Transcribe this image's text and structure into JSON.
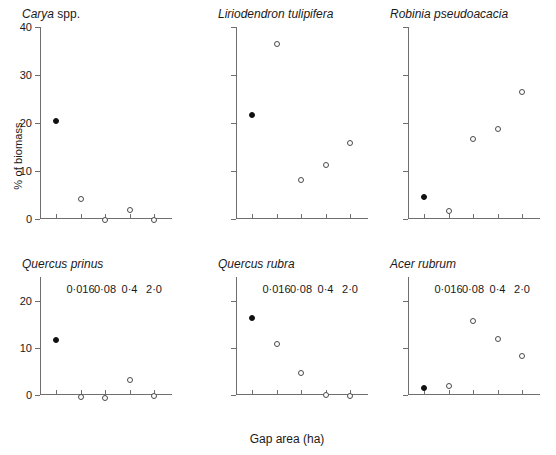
{
  "figure": {
    "ylabel": "% of biomass",
    "xlabel": "Gap area (ha)",
    "caption": ""
  },
  "chart_data": {
    "type": "scatter",
    "title": "",
    "xlabel": "Gap area (ha)",
    "ylabel": "% of biomass",
    "x_tick_labels": [
      "",
      "0·016",
      "0·08",
      "0·4",
      "2·0"
    ],
    "x_categories": [
      "control",
      "0.016",
      "0.08",
      "0.4",
      "2.0"
    ],
    "grid": false,
    "legend": "none",
    "marker_types": {
      "filled": "closed circle (first gap-area class)",
      "open": "open circle"
    },
    "panels": [
      {
        "name": "Carya spp.",
        "title_italic": "Carya",
        "title_roman": " spp.",
        "ylim": [
          0,
          40
        ],
        "y_ticks": [
          0,
          10,
          20,
          30,
          40
        ],
        "show_x_labels": false,
        "show_y_labels": true,
        "points": [
          {
            "x": 0,
            "y": 21.0,
            "fill": "filled"
          },
          {
            "x": 1,
            "y": 4.8,
            "fill": "open"
          },
          {
            "x": 2,
            "y": 0.5,
            "fill": "open"
          },
          {
            "x": 3,
            "y": 2.5,
            "fill": "open"
          },
          {
            "x": 4,
            "y": 0.5,
            "fill": "open"
          }
        ]
      },
      {
        "name": "Liriodendron tulipifera",
        "title_italic": "Liriodendron tulipifera",
        "title_roman": "",
        "ylim": [
          0,
          40
        ],
        "y_ticks": [
          0,
          10,
          20,
          30,
          40
        ],
        "show_x_labels": false,
        "show_y_labels": false,
        "points": [
          {
            "x": 0,
            "y": 22.2,
            "fill": "filled"
          },
          {
            "x": 1,
            "y": 37.0,
            "fill": "open"
          },
          {
            "x": 2,
            "y": 8.8,
            "fill": "open"
          },
          {
            "x": 3,
            "y": 11.8,
            "fill": "open"
          },
          {
            "x": 4,
            "y": 16.5,
            "fill": "open"
          }
        ]
      },
      {
        "name": "Robinia pseudoacacia",
        "title_italic": "Robinia pseudoacacia",
        "title_roman": "",
        "ylim": [
          0,
          40
        ],
        "y_ticks": [
          0,
          10,
          20,
          30,
          40
        ],
        "show_x_labels": false,
        "show_y_labels": false,
        "points": [
          {
            "x": 0,
            "y": 5.2,
            "fill": "filled"
          },
          {
            "x": 1,
            "y": 2.3,
            "fill": "open"
          },
          {
            "x": 2,
            "y": 17.3,
            "fill": "open"
          },
          {
            "x": 3,
            "y": 19.3,
            "fill": "open"
          },
          {
            "x": 4,
            "y": 27.0,
            "fill": "open"
          }
        ]
      },
      {
        "name": "Quercus prinus",
        "title_italic": "Quercus prinus",
        "title_roman": "",
        "ylim": [
          0,
          25
        ],
        "y_ticks": [
          0,
          10,
          20
        ],
        "show_x_labels": true,
        "show_y_labels": true,
        "points": [
          {
            "x": 0,
            "y": 12.3,
            "fill": "filled"
          },
          {
            "x": 1,
            "y": 0.2,
            "fill": "open"
          },
          {
            "x": 2,
            "y": 0.1,
            "fill": "open"
          },
          {
            "x": 3,
            "y": 3.9,
            "fill": "open"
          },
          {
            "x": 4,
            "y": 0.5,
            "fill": "open"
          }
        ]
      },
      {
        "name": "Quercus rubra",
        "title_italic": "Quercus rubra",
        "title_roman": "",
        "ylim": [
          0,
          25
        ],
        "y_ticks": [
          0,
          10,
          20
        ],
        "show_x_labels": true,
        "show_y_labels": false,
        "points": [
          {
            "x": 0,
            "y": 17.0,
            "fill": "filled"
          },
          {
            "x": 1,
            "y": 11.5,
            "fill": "open"
          },
          {
            "x": 2,
            "y": 5.3,
            "fill": "open"
          },
          {
            "x": 3,
            "y": 0.6,
            "fill": "open"
          },
          {
            "x": 4,
            "y": 0.5,
            "fill": "open"
          }
        ]
      },
      {
        "name": "Acer rubrum",
        "title_italic": "Acer rubrum",
        "title_roman": "",
        "ylim": [
          0,
          25
        ],
        "y_ticks": [
          0,
          10,
          20
        ],
        "show_x_labels": true,
        "show_y_labels": false,
        "points": [
          {
            "x": 0,
            "y": 2.2,
            "fill": "filled"
          },
          {
            "x": 1,
            "y": 2.5,
            "fill": "open"
          },
          {
            "x": 2,
            "y": 16.3,
            "fill": "open"
          },
          {
            "x": 3,
            "y": 12.5,
            "fill": "open"
          },
          {
            "x": 4,
            "y": 9.0,
            "fill": "open"
          }
        ]
      }
    ]
  }
}
